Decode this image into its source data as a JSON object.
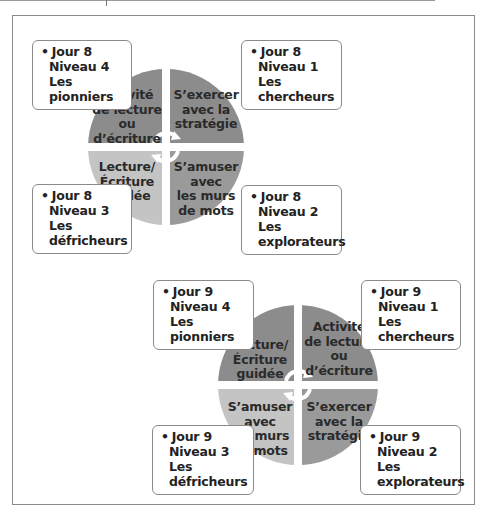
{
  "colors": {
    "dark": "#8c8c8c",
    "medium": "#9e9e9e",
    "light": "#c4c4c4",
    "border": "#8a8a8a"
  },
  "diagrams": [
    {
      "quadrants": {
        "top_left": {
          "lines": [
            "Activité",
            "de lecture",
            "ou",
            "d’écriture"
          ],
          "shade": "dark"
        },
        "top_right": {
          "lines": [
            "S’exercer",
            "avec la",
            "stratégie"
          ],
          "shade": "dark"
        },
        "bottom_left": {
          "lines": [
            "Lecture/",
            "Écriture",
            "guidée"
          ],
          "shade": "light"
        },
        "bottom_right": {
          "lines": [
            "S’amuser",
            "avec",
            "les murs",
            "de mots"
          ],
          "shade": "dark"
        }
      },
      "boxes": {
        "top_left": {
          "day": "Jour 8",
          "level": "Niveau 4",
          "group_1": "Les",
          "group_2": "pionniers"
        },
        "top_right": {
          "day": "Jour 8",
          "level": "Niveau 1",
          "group_1": "Les",
          "group_2": "chercheurs"
        },
        "bottom_left": {
          "day": "Jour 8",
          "level": "Niveau 3",
          "group_1": "Les",
          "group_2": "défricheurs"
        },
        "bottom_right": {
          "day": "Jour 8",
          "level": "Niveau 2",
          "group_1": "Les",
          "group_2": "explorateurs"
        }
      }
    },
    {
      "quadrants": {
        "top_left": {
          "lines": [
            "Lecture/",
            "Écriture",
            "guidée"
          ],
          "shade": "dark"
        },
        "top_right": {
          "lines": [
            "Activité",
            "de lecture",
            "ou",
            "d’écriture"
          ],
          "shade": "dark"
        },
        "bottom_left": {
          "lines": [
            "S’amuser",
            "avec",
            "les murs",
            "de mots"
          ],
          "shade": "light"
        },
        "bottom_right": {
          "lines": [
            "S’exercer",
            "avec la",
            "stratégie"
          ],
          "shade": "dark"
        }
      },
      "boxes": {
        "top_left": {
          "day": "Jour 9",
          "level": "Niveau 4",
          "group_1": "Les",
          "group_2": "pionniers"
        },
        "top_right": {
          "day": "Jour 9",
          "level": "Niveau 1",
          "group_1": "Les",
          "group_2": "chercheurs"
        },
        "bottom_left": {
          "day": "Jour 9",
          "level": "Niveau 3",
          "group_1": "Les",
          "group_2": "défricheurs"
        },
        "bottom_right": {
          "day": "Jour 9",
          "level": "Niveau 2",
          "group_1": "Les",
          "group_2": "explorateurs"
        }
      }
    }
  ],
  "bullet": "•"
}
